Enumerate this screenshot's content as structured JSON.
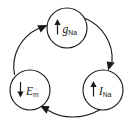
{
  "diagram": {
    "background_color": "#ffffff",
    "line_color": "#1a1a1a",
    "width": 132,
    "height": 123,
    "nodes": [
      {
        "id": "g-na",
        "symbol": "g",
        "subscript": "Na",
        "label": "gNa",
        "direction": "up",
        "direction_glyph": "↑",
        "cx": 67,
        "cy": 28,
        "r": 20
      },
      {
        "id": "i-na",
        "symbol": "I",
        "subscript": "Na",
        "label": "INa",
        "direction": "up",
        "direction_glyph": "↑",
        "cx": 103,
        "cy": 90,
        "r": 20
      },
      {
        "id": "e-m",
        "symbol": "E",
        "subscript": "m",
        "label": "Em",
        "direction": "down",
        "direction_glyph": "↓",
        "cx": 30,
        "cy": 90,
        "r": 20
      }
    ],
    "edges": [
      {
        "id": "edge-gna-to-ina",
        "from": "g-na",
        "to": "i-na",
        "style": "curved-arrow"
      },
      {
        "id": "edge-ina-to-em",
        "from": "i-na",
        "to": "e-m",
        "style": "curved-arrow"
      },
      {
        "id": "edge-em-to-gna",
        "from": "e-m",
        "to": "g-na",
        "style": "curved-arrow"
      }
    ]
  }
}
